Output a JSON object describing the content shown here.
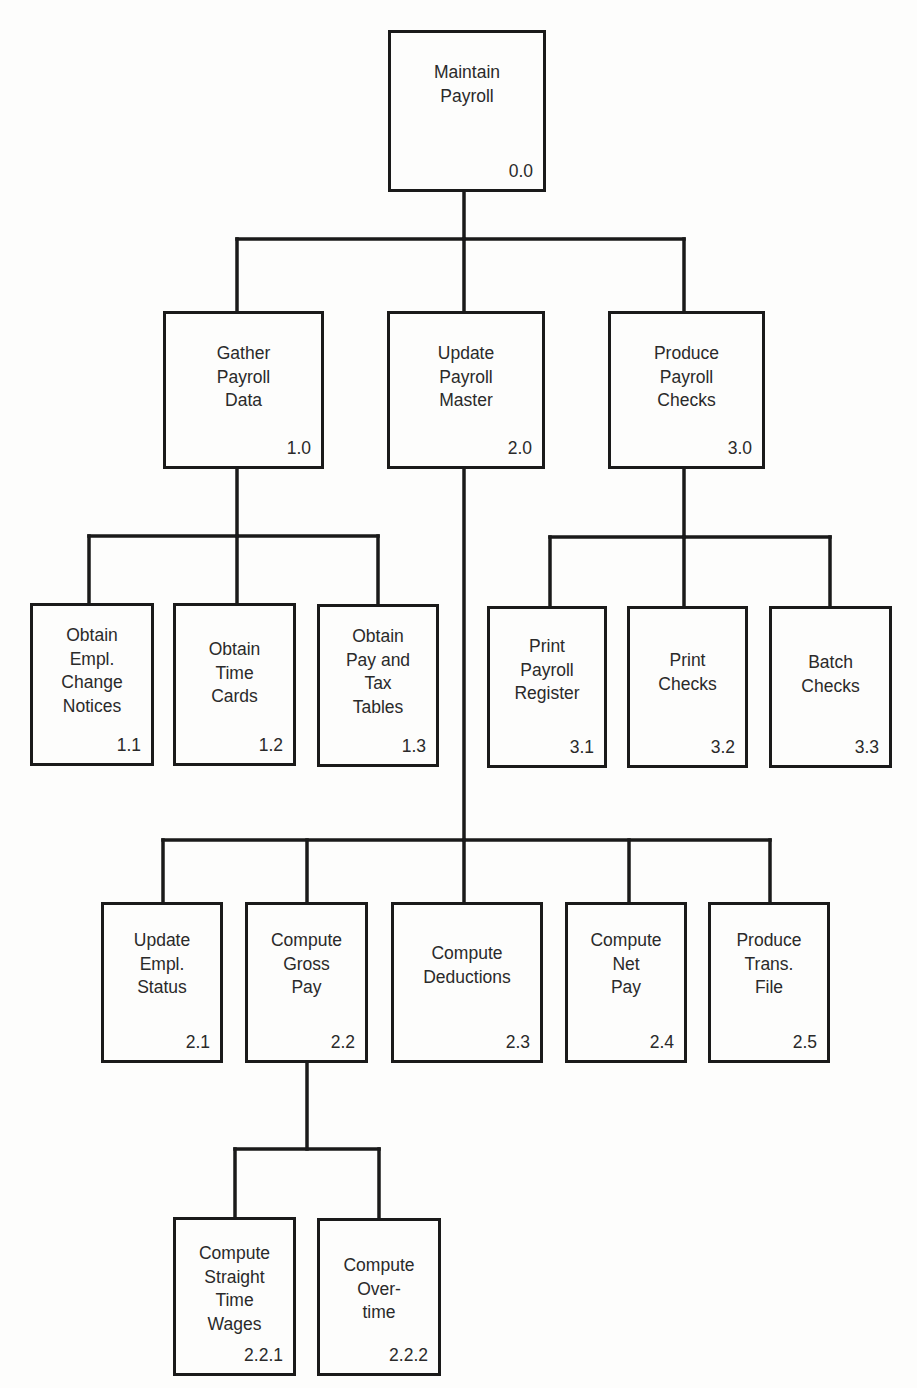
{
  "diagram": {
    "type": "hierarchy-chart",
    "line_color": "#1a1a1a",
    "nodes": {
      "n0_0": {
        "label": "Maintain\nPayroll",
        "number": "0.0"
      },
      "n1_0": {
        "label": "Gather\nPayroll\nData",
        "number": "1.0"
      },
      "n2_0": {
        "label": "Update\nPayroll\nMaster",
        "number": "2.0"
      },
      "n3_0": {
        "label": "Produce\nPayroll\nChecks",
        "number": "3.0"
      },
      "n1_1": {
        "label": "Obtain\nEmpl.\nChange\nNotices",
        "number": "1.1"
      },
      "n1_2": {
        "label": "Obtain\nTime\nCards",
        "number": "1.2"
      },
      "n1_3": {
        "label": "Obtain\nPay and\nTax\nTables",
        "number": "1.3"
      },
      "n3_1": {
        "label": "Print\nPayroll\nRegister",
        "number": "3.1"
      },
      "n3_2": {
        "label": "Print\nChecks",
        "number": "3.2"
      },
      "n3_3": {
        "label": "Batch\nChecks",
        "number": "3.3"
      },
      "n2_1": {
        "label": "Update\nEmpl.\nStatus",
        "number": "2.1"
      },
      "n2_2": {
        "label": "Compute\nGross\nPay",
        "number": "2.2"
      },
      "n2_3": {
        "label": "Compute\nDeductions",
        "number": "2.3"
      },
      "n2_4": {
        "label": "Compute\nNet\nPay",
        "number": "2.4"
      },
      "n2_5": {
        "label": "Produce\nTrans.\nFile",
        "number": "2.5"
      },
      "n2_2_1": {
        "label": "Compute\nStraight\nTime\nWages",
        "number": "2.2.1"
      },
      "n2_2_2": {
        "label": "Compute\nOver-\ntime",
        "number": "2.2.2"
      }
    },
    "edges": [
      [
        "0.0",
        "1.0"
      ],
      [
        "0.0",
        "2.0"
      ],
      [
        "0.0",
        "3.0"
      ],
      [
        "1.0",
        "1.1"
      ],
      [
        "1.0",
        "1.2"
      ],
      [
        "1.0",
        "1.3"
      ],
      [
        "3.0",
        "3.1"
      ],
      [
        "3.0",
        "3.2"
      ],
      [
        "3.0",
        "3.3"
      ],
      [
        "2.0",
        "2.1"
      ],
      [
        "2.0",
        "2.2"
      ],
      [
        "2.0",
        "2.3"
      ],
      [
        "2.0",
        "2.4"
      ],
      [
        "2.0",
        "2.5"
      ],
      [
        "2.2",
        "2.2.1"
      ],
      [
        "2.2",
        "2.2.2"
      ]
    ]
  }
}
